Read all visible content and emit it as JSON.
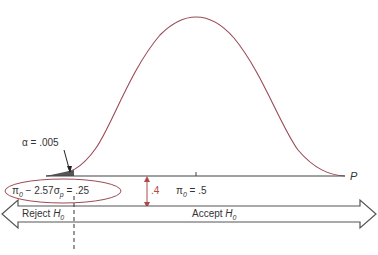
{
  "diagram": {
    "colors": {
      "curve": "#9a4a55",
      "axis": "#444444",
      "annotation_red": "#b04a4a",
      "arrow_outline": "#555555"
    },
    "curve": {
      "type": "normal",
      "mean_label": "π0 = .5",
      "mean": 0.5
    },
    "axis": {
      "label": "P"
    },
    "alpha_label": {
      "symbol": "α",
      "equals": "=",
      "value": ".005"
    },
    "critical_value": {
      "pi": "π",
      "sub0": "0",
      "expr": " − 2.57σ",
      "subp": "p",
      "result": " = .25"
    },
    "distance_label": ".4",
    "mean_label": {
      "pi": "π",
      "sub0": "0",
      "rest": " = .5"
    },
    "reject_region": {
      "text": "Reject ",
      "h": "H",
      "sub": "0"
    },
    "accept_region": {
      "text": "Accept ",
      "h": "H",
      "sub": "0"
    }
  }
}
